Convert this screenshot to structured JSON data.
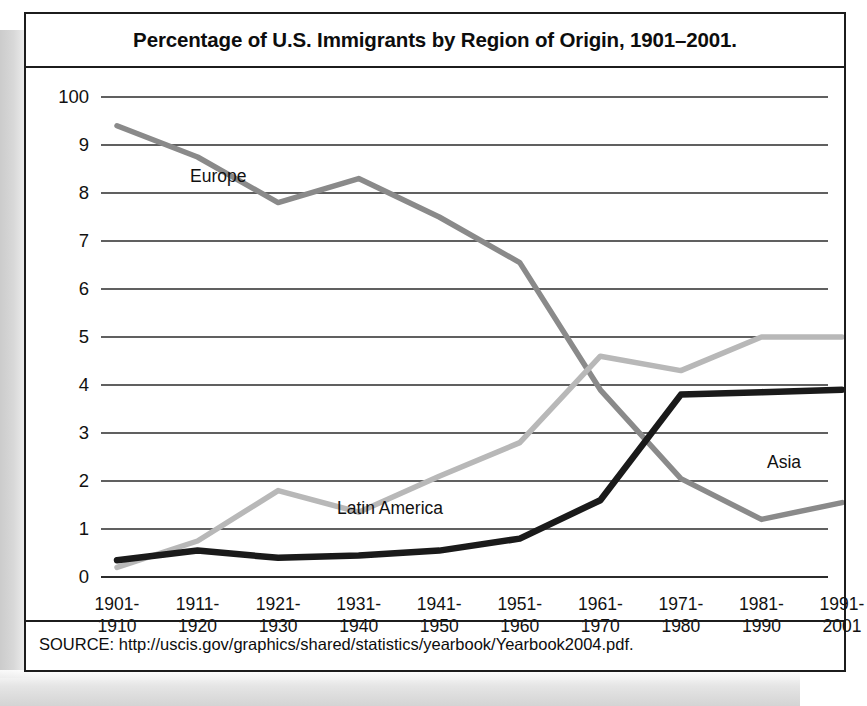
{
  "figure": {
    "title": "Percentage of U.S. Immigrants by Region of Origin, 1901–2001.",
    "source": "SOURCE: http://uscis.gov/graphics/shared/statistics/yearbook/Yearbook2004.pdf."
  },
  "colors": {
    "europe": "#8a8a8a",
    "latin_america": "#b8b8b8",
    "asia": "#1a1a1a",
    "gridline": "#2b2b2b",
    "frame": "#1c1c1c",
    "text": "#111111"
  },
  "chart_data": {
    "type": "line",
    "title": "Percentage of U.S. Immigrants by Region of Origin, 1901–2001.",
    "xlabel": "",
    "ylabel": "",
    "grid": true,
    "legend": "inline-labels",
    "ylim": [
      0,
      10
    ],
    "ytick_labels": [
      "100",
      "9",
      "8",
      "7",
      "6",
      "5",
      "4",
      "3",
      "2",
      "1",
      "0"
    ],
    "ytick_values": [
      10,
      9,
      8,
      7,
      6,
      5,
      4,
      3,
      2,
      1,
      0
    ],
    "categories": [
      "1901–1910",
      "1911–1920",
      "1921–1930",
      "1931–1940",
      "1941–1950",
      "1951–1960",
      "1961–1970",
      "1971–1980",
      "1981–1990",
      "1991–2001"
    ],
    "xtick_lines": [
      [
        "1901-",
        "1910"
      ],
      [
        "1911-",
        "1920"
      ],
      [
        "1921-",
        "1930"
      ],
      [
        "1931-",
        "1940"
      ],
      [
        "1941-",
        "1950"
      ],
      [
        "1951-",
        "1960"
      ],
      [
        "1961-",
        "1970"
      ],
      [
        "1971-",
        "1980"
      ],
      [
        "1981-",
        "1990"
      ],
      [
        "1991-",
        "2001"
      ]
    ],
    "series": [
      {
        "name": "Europe",
        "color": "#8a8a8a",
        "values": [
          9.4,
          8.75,
          7.8,
          8.3,
          7.5,
          6.55,
          3.9,
          2.05,
          1.2,
          1.55
        ]
      },
      {
        "name": "Latin America",
        "color": "#b8b8b8",
        "values": [
          0.2,
          0.75,
          1.8,
          1.35,
          2.1,
          2.8,
          4.6,
          4.3,
          5.0,
          5.0
        ]
      },
      {
        "name": "Asia",
        "color": "#1a1a1a",
        "values": [
          0.35,
          0.55,
          0.4,
          0.45,
          0.55,
          0.8,
          1.6,
          3.8,
          3.85,
          3.9
        ]
      }
    ]
  }
}
